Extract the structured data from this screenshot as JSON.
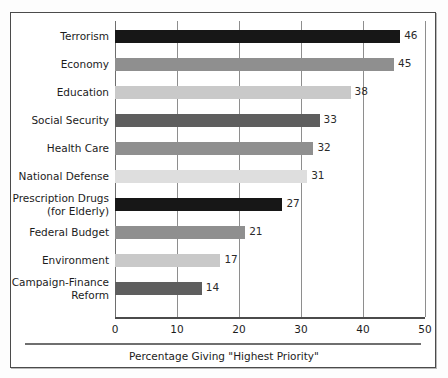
{
  "chart_data": {
    "type": "bar",
    "orientation": "horizontal",
    "title": "",
    "subtitle": "",
    "caption": "Percentage Giving \"Highest Priority\"",
    "xlabel": "Percentage Giving \"Highest Priority\"",
    "ylabel": "",
    "xlim": [
      0,
      50
    ],
    "xticks": [
      0,
      10,
      20,
      30,
      40,
      50
    ],
    "xtick_labels": [
      "0",
      "10",
      "20",
      "30",
      "40",
      "50"
    ],
    "grid": true,
    "grid_axis": "x",
    "legend": "none",
    "categories": [
      "Terrorism",
      "Economy",
      "Education",
      "Social Security",
      "Health Care",
      "National Defense",
      "Prescription Drugs\n(for Elderly)",
      "Federal Budget",
      "Environment",
      "Campaign-Finance\nReform"
    ],
    "values": [
      46,
      45,
      38,
      33,
      32,
      31,
      27,
      21,
      17,
      14
    ],
    "value_labels": [
      "46",
      "45",
      "38",
      "33",
      "32",
      "31",
      "27",
      "21",
      "17",
      "14"
    ],
    "bar_colors": [
      "#171717",
      "#8f8f8f",
      "#c9c9c9",
      "#5e5e5e",
      "#8f8f8f",
      "#dedede",
      "#171717",
      "#8f8f8f",
      "#c9c9c9",
      "#5e5e5e"
    ]
  },
  "style": {
    "frame_border_color": "#4b4b4b",
    "gridline_color": "#8e8e8e",
    "axis_color": "#4b4b4b",
    "text_color": "#1c1c1c",
    "background": "#ffffff"
  }
}
